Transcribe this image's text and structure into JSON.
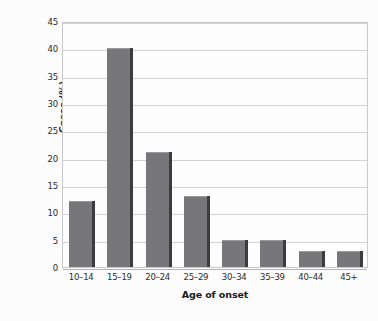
{
  "chart_data": {
    "type": "bar",
    "title": "",
    "xlabel": "Age of onset",
    "ylabel": "Cases (%)",
    "categories": [
      "10–14",
      "15–19",
      "20–24",
      "25–29",
      "30–34",
      "35–39",
      "40–44",
      "45+"
    ],
    "values": [
      12,
      40,
      21,
      13,
      5,
      5,
      3,
      3
    ],
    "ylim": [
      0,
      45
    ],
    "yticks": [
      0,
      5,
      10,
      15,
      20,
      25,
      30,
      35,
      40,
      45
    ],
    "ytick_labels": [
      "0",
      "5",
      "10",
      "15",
      "20",
      "25",
      "30",
      "35",
      "40",
      "45"
    ],
    "grid": true,
    "grid_axis": "y",
    "legend": false,
    "legend_position": "none",
    "bar_color": "#77777a",
    "bar_edge_color": "#3c3c40",
    "gridline_color": "#d2d2d5",
    "axis_color": "#c9c9cc",
    "text_color": "#1a1a1a",
    "background_color": "#fcfcfc"
  }
}
